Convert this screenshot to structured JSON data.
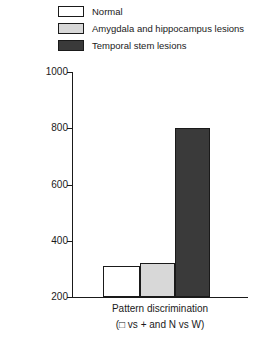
{
  "chart_data": {
    "type": "bar",
    "title": "",
    "xlabel": "Pattern discrimination",
    "xlabel_sub": "(□ vs + and N vs W)",
    "ylabel": "Median number of trials to learn task",
    "ylim": [
      200,
      1000
    ],
    "ytick_labels": [
      "1000",
      "800",
      "600",
      "400",
      "200"
    ],
    "ytick_values": [
      1000,
      800,
      600,
      400,
      200
    ],
    "grid": false,
    "legend_position": "top-left",
    "categories": [
      "Pattern discrimination"
    ],
    "series": [
      {
        "name": "Normal",
        "values": [
          310
        ],
        "color": "#ffffff",
        "edge_color": "#1a1a1a"
      },
      {
        "name": "Amygdala and hippocampus lesions",
        "values": [
          320
        ],
        "color": "#d8d8d8",
        "edge_color": "#1a1a1a"
      },
      {
        "name": "Temporal stem lesions",
        "values": [
          800
        ],
        "color": "#3a3a3a",
        "edge_color": "#1a1a1a"
      }
    ]
  },
  "legend": {
    "items": [
      {
        "label": "Normal",
        "swatch": "legend-swatch-normal"
      },
      {
        "label": "Amygdala and hippocampus lesions",
        "swatch": "legend-swatch-amygdala"
      },
      {
        "label": "Temporal stem lesions",
        "swatch": "legend-swatch-temporal"
      }
    ]
  },
  "axes": {
    "y_title": "Median number of trials to learn task",
    "y_labels": {
      "t1000": "1000",
      "t800": "800",
      "t600": "600",
      "t400": "400",
      "t200": "200"
    },
    "x_caption_main": "Pattern discrimination",
    "x_caption_sub": "(□ vs + and N vs W)"
  }
}
